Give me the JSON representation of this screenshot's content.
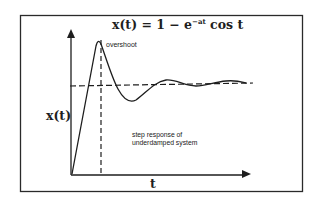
{
  "figure": {
    "title": {
      "lhs": "x(t) = 1 − e",
      "exponent": "−at",
      "rhs": " cos t"
    },
    "y_axis_label": "x(t)",
    "x_axis_label": "t",
    "annotations": {
      "peak_label": "overshoot",
      "caption_line1": "step response of",
      "caption_line2": "underdamped system"
    },
    "colors": {
      "background": "#ffffff",
      "ink": "#1e1e1e",
      "frame": "#2a2a2a"
    }
  }
}
